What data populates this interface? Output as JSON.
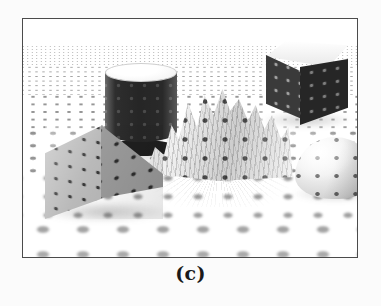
{
  "figure": {
    "caption": "(c)",
    "panel_border_color": "#4b4b4b",
    "background_color": "#fbfbfb",
    "scene_description": "Grayscale rendered 3D scene: polka-dot textured objects resting on a receding polka-dot ground plane",
    "rendering_style": "grayscale halftone print",
    "objects": [
      {
        "name": "cylinder",
        "label": "textured cylinder",
        "shade": "dark body with light elliptical top cap",
        "position": "upper left"
      },
      {
        "name": "pyramid",
        "label": "textured pyramid",
        "shade": "mid-gray faces",
        "position": "left foreground"
      },
      {
        "name": "cube",
        "label": "textured cube",
        "shade": "light top face, dark side faces",
        "position": "upper right"
      },
      {
        "name": "hemisphere",
        "label": "textured hemisphere",
        "shade": "light dome with dark dots",
        "position": "right middle"
      },
      {
        "name": "terrain",
        "label": "crumpled mountain surface",
        "shade": "high-frequency folded relief",
        "position": "center"
      },
      {
        "name": "ground-plane",
        "label": "polka-dot ground plane",
        "shade": "white with gray dots receding to the horizon",
        "position": "full scene"
      }
    ]
  }
}
